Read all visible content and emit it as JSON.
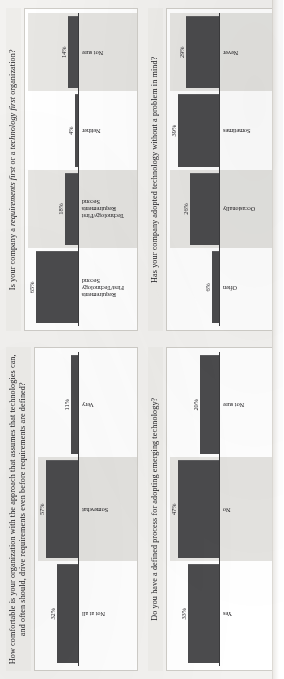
{
  "page": {
    "document_type": "survey-results-bar-charts",
    "orientation": "rotated-90-ccw"
  },
  "colors": {
    "bar": "#4b4b4d",
    "plot_background": "#ffffff",
    "page_background": "#f3f2f0",
    "title_background": "#eeedea",
    "axis": "#3b3b3d",
    "band_shade": "#e7e6e3"
  },
  "charts": [
    {
      "id": "comfort-technology-drives-requirements",
      "title_parts": [
        {
          "text": "How comfortable is your organization with the approach that assumes that technologies can, and often should, drive requirements even before requirements are defined?",
          "italic": false
        }
      ],
      "title_plain": "How comfortable is your organization with the approach that assumes that technologies can, and often should, drive requirements even before requirements are defined?",
      "chart_data": {
        "type": "bar",
        "title": "How comfortable is your organization with the approach that assumes that technologies can, and often should, drive requirements even before requirements are defined?",
        "categories": [
          "Not at all",
          "Somewhat",
          "Very"
        ],
        "values": [
          32,
          57,
          11
        ],
        "value_labels": [
          "32%",
          "57%",
          "11%"
        ],
        "xlabel": "",
        "ylabel": "",
        "ylim": [
          0,
          62
        ],
        "grid": false,
        "legend": "none"
      }
    },
    {
      "id": "requirements-first-or-technology-first",
      "title_parts": [
        {
          "text": "Is your company a ",
          "italic": false
        },
        {
          "text": "requirements first",
          "italic": true
        },
        {
          "text": " or a ",
          "italic": false
        },
        {
          "text": "technology first",
          "italic": true
        },
        {
          "text": " organization?",
          "italic": false
        }
      ],
      "title_plain": "Is your company a requirements first or a technology first organization?",
      "chart_data": {
        "type": "bar",
        "title": "Is your company a requirements first or a technology first organization?",
        "categories": [
          "Requirements First/Technology Second",
          "Technology/First Requirements Second",
          "Neither",
          "Not sure"
        ],
        "values": [
          65,
          18,
          4,
          14
        ],
        "value_labels": [
          "65%",
          "18%",
          "4%",
          "14%"
        ],
        "xlabel": "",
        "ylabel": "",
        "ylim": [
          0,
          70
        ],
        "grid": false,
        "legend": "none"
      }
    },
    {
      "id": "defined-process-adopting-emerging-technology",
      "title_parts": [
        {
          "text": "Do you have a defined process for adopting emerging technology?",
          "italic": false
        }
      ],
      "title_plain": "Do you have a defined process for adopting emerging technology?",
      "chart_data": {
        "type": "bar",
        "title": "Do you have a defined process for adopting emerging technology?",
        "categories": [
          "Yes",
          "No",
          "Not sure"
        ],
        "values": [
          33,
          47,
          20
        ],
        "value_labels": [
          "33%",
          "47%",
          "20%"
        ],
        "xlabel": "",
        "ylabel": "",
        "ylim": [
          0,
          52
        ],
        "grid": false,
        "legend": "none"
      }
    },
    {
      "id": "adopted-technology-without-problem-in-mind",
      "title_parts": [
        {
          "text": "Has your company adopted technology without a problem in mind?",
          "italic": false
        }
      ],
      "title_plain": "Has your company adopted technology without a problem in mind?",
      "chart_data": {
        "type": "bar",
        "title": "Has your company adopted technology without a problem in mind?",
        "categories": [
          "Often",
          "Occasionally",
          "Sometimes",
          "Never"
        ],
        "values": [
          6,
          26,
          39,
          29
        ],
        "value_labels": [
          "6%",
          "26%",
          "39%",
          "29%"
        ],
        "xlabel": "",
        "ylabel": "",
        "ylim": [
          0,
          44
        ],
        "grid": false,
        "legend": "none"
      }
    }
  ]
}
